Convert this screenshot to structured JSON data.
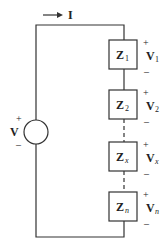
{
  "diagram": {
    "type": "series impedance circuit",
    "current": {
      "label": "I",
      "direction": "right"
    },
    "source": {
      "label": "V",
      "plus": "+",
      "minus": "–"
    },
    "impedances": [
      {
        "name": "Z",
        "sub": "1",
        "voltage": "V",
        "vsub": "1",
        "plus": "+",
        "minus": "–",
        "italic_sub": false
      },
      {
        "name": "Z",
        "sub": "2",
        "voltage": "V",
        "vsub": "2",
        "plus": "+",
        "minus": "–",
        "italic_sub": false
      },
      {
        "name": "Z",
        "sub": "x",
        "voltage": "V",
        "vsub": "x",
        "plus": "+",
        "minus": "–",
        "italic_sub": true
      },
      {
        "name": "Z",
        "sub": "n",
        "voltage": "V",
        "vsub": "n",
        "plus": "+",
        "minus": "–",
        "italic_sub": true
      }
    ],
    "colors": {
      "line": "#333333",
      "background": "#ffffff"
    }
  }
}
